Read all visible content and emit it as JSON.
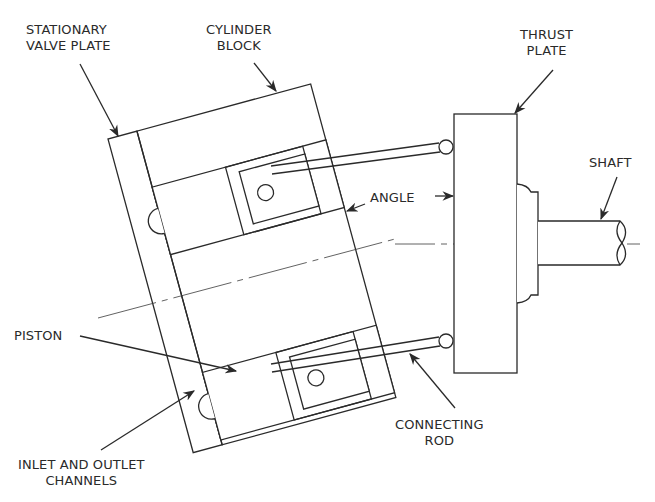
{
  "diagram": {
    "labels": {
      "stationary_valve_plate": "STATIONARY\nVALVE PLATE",
      "cylinder_block": "CYLINDER\nBLOCK",
      "thrust_plate": "THRUST\nPLATE",
      "shaft": "SHAFT",
      "angle": "ANGLE",
      "piston": "PISTON",
      "connecting_rod": "CONNECTING\nROD",
      "inlet_outlet_channels": "INLET AND OUTLET\nCHANNELS"
    },
    "colors": {
      "line": "#2a2a2a",
      "background": "#ffffff"
    }
  }
}
